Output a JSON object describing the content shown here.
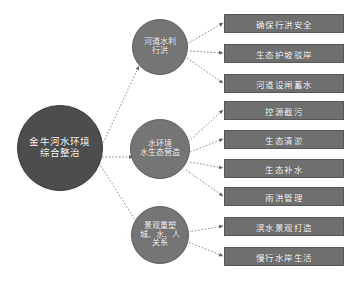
{
  "diagram": {
    "type": "radial-tree",
    "background_color": "#ffffff",
    "colors": {
      "root_fill": "#4d4d4d",
      "branch_fill": "#757575",
      "leaf_fill": "#6f6f6f",
      "edge": "#7d7d7d",
      "text": "#ffffff"
    },
    "root": {
      "label": "金牛河水环境\n综合整治",
      "line1": "金牛河水环境",
      "line2": "综合整治"
    },
    "branches": [
      {
        "id": "hydraulic",
        "label": "河道水利\n行洪",
        "leaves": [
          {
            "label": "确保行洪安全"
          },
          {
            "label": "生态护坡驳岸"
          },
          {
            "label": "河道设闸蓄水"
          }
        ]
      },
      {
        "id": "ecology",
        "label": "水环境\n水生态营造",
        "leaves": [
          {
            "label": "控源截污"
          },
          {
            "label": "生态清淤"
          },
          {
            "label": "生态补水"
          },
          {
            "label": "雨洪管理"
          }
        ]
      },
      {
        "id": "landscape",
        "label": "景观重塑\n城、水、人\n关系",
        "leaves": [
          {
            "label": "滨水景观打造"
          },
          {
            "label": "慢行水岸生活"
          }
        ]
      }
    ]
  }
}
